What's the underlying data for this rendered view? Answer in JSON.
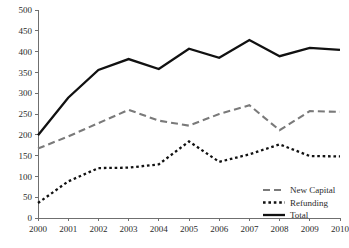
{
  "chart_data": {
    "type": "line",
    "title": "",
    "subtitle": "",
    "xlabel": "",
    "ylabel": "",
    "categories": [
      "2000",
      "2001",
      "2002",
      "2003",
      "2004",
      "2005",
      "2006",
      "2007",
      "2008",
      "2009",
      "2010"
    ],
    "x": [
      2000,
      2001,
      2002,
      2003,
      2004,
      2005,
      2006,
      2007,
      2008,
      2009,
      2010
    ],
    "ylim": [
      0,
      500
    ],
    "ytick_labels": [
      "0",
      "50",
      "100",
      "150",
      "200",
      "250",
      "300",
      "350",
      "400",
      "450",
      "500"
    ],
    "yticks": [
      0,
      50,
      100,
      150,
      200,
      250,
      300,
      350,
      400,
      450,
      500
    ],
    "grid": false,
    "legend_position": "bottom-right",
    "series": [
      {
        "name": "New Capital",
        "values": [
          167,
          196,
          228,
          260,
          234,
          222,
          250,
          271,
          211,
          257,
          255
        ],
        "color": "#7a7a7a",
        "style": "dashed",
        "width": 2.1
      },
      {
        "name": "Refunding",
        "values": [
          36,
          88,
          120,
          121,
          129,
          184,
          135,
          153,
          177,
          149,
          148
        ],
        "color": "#111111",
        "style": "dotted",
        "width": 2.3
      },
      {
        "name": "Total",
        "values": [
          199,
          289,
          356,
          382,
          358,
          407,
          385,
          428,
          389,
          409,
          404
        ],
        "color": "#111111",
        "style": "solid",
        "width": 2.3
      }
    ]
  },
  "legend": {
    "items": [
      {
        "label": "New Capital"
      },
      {
        "label": "Refunding"
      },
      {
        "label": "Total"
      }
    ]
  }
}
